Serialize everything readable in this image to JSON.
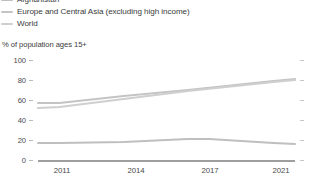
{
  "chart_data": {
    "type": "line",
    "title": "",
    "subtitle": "",
    "ylabel": "% of population ages 15+",
    "xlabel": "",
    "ylim": [
      0,
      100
    ],
    "xlim": [
      2010,
      2022
    ],
    "yticks": [
      0,
      20,
      40,
      60,
      80,
      100
    ],
    "xticks": [
      2011,
      2014,
      2017,
      2021
    ],
    "grid": false,
    "legend_position": "top-left",
    "series": [
      {
        "name": "Afghanistan",
        "color": "#bfbfbf",
        "x": [
          2010,
          2011,
          2014,
          2017,
          2018,
          2021,
          2022
        ],
        "values": [
          17,
          17,
          18,
          21,
          21,
          17,
          16
        ]
      },
      {
        "name": "Europe and Central Asia (excluding high income)",
        "color": "#c4c4c4",
        "x": [
          2010,
          2011,
          2014,
          2017,
          2021,
          2022
        ],
        "values": [
          57,
          57,
          64,
          70,
          79,
          81
        ]
      },
      {
        "name": "World",
        "color": "#cfcfcf",
        "x": [
          2010,
          2011,
          2014,
          2017,
          2021,
          2022
        ],
        "values": [
          52,
          53,
          61,
          69,
          78,
          80
        ]
      }
    ]
  },
  "legend": {
    "items": [
      {
        "label": "Afghanistan",
        "color": "#bfbfbf"
      },
      {
        "label": "Europe and Central Asia (excluding high income)",
        "color": "#c4c4c4"
      },
      {
        "label": "World",
        "color": "#cfcfcf"
      }
    ]
  },
  "axis": {
    "y_title": "% of population ages 15+",
    "y_tick_labels": [
      "100",
      "80",
      "60",
      "40",
      "20",
      "0"
    ],
    "x_tick_labels": [
      "2011",
      "2014",
      "2017",
      "2021"
    ]
  },
  "footer": {
    "cut_text": ""
  }
}
